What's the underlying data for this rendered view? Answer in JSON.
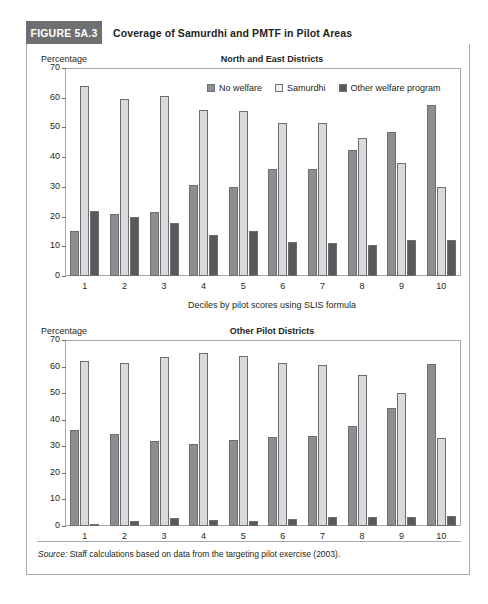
{
  "figure": {
    "badge": "FIGURE 5A.3",
    "title": "Coverage of Samurdhi and PMTF in Pilot Areas",
    "source_label": "Source:",
    "source_text": " Staff calculations based on data from the targeting pilot exercise (2003)."
  },
  "legend": {
    "items": [
      {
        "label": "No welfare",
        "color": "#8d8e90",
        "key": "nowelfare"
      },
      {
        "label": "Samurdhi",
        "color": "#f1f1f1",
        "key": "samurdhi"
      },
      {
        "label": "Other welfare program",
        "color": "#58595b",
        "key": "other"
      }
    ]
  },
  "chart_data": [
    {
      "type": "bar",
      "title": "North and East Districts",
      "ylabel": "Percentage",
      "xlabel": "Deciles by pilot scores using SLIS formula",
      "categories": [
        "1",
        "2",
        "3",
        "4",
        "5",
        "6",
        "7",
        "8",
        "9",
        "10"
      ],
      "ylim": [
        0,
        70
      ],
      "yticks": [
        0,
        10,
        20,
        30,
        40,
        50,
        60,
        70
      ],
      "grid": false,
      "legend_position": "top-right",
      "series": [
        {
          "name": "No welfare",
          "color": "#8d8e90",
          "values": [
            15.0,
            21.0,
            21.5,
            30.5,
            30.0,
            36.0,
            36.0,
            42.5,
            48.5,
            57.5
          ]
        },
        {
          "name": "Samurdhi",
          "color": "#d9dadb",
          "values": [
            64.0,
            59.5,
            60.5,
            56.0,
            55.5,
            51.5,
            51.5,
            46.5,
            38.0,
            30.0
          ]
        },
        {
          "name": "Other welfare program",
          "color": "#58595b",
          "values": [
            22.0,
            20.0,
            18.0,
            13.8,
            15.0,
            11.5,
            11.0,
            10.5,
            12.0,
            12.0
          ]
        }
      ]
    },
    {
      "type": "bar",
      "title": "Other Pilot Districts",
      "ylabel": "Percentage",
      "xlabel": "",
      "categories": [
        "1",
        "2",
        "3",
        "4",
        "5",
        "6",
        "7",
        "8",
        "9",
        "10"
      ],
      "ylim": [
        0,
        70
      ],
      "yticks": [
        0,
        10,
        20,
        30,
        40,
        50,
        60,
        70
      ],
      "grid": false,
      "legend_position": "none",
      "series": [
        {
          "name": "No welfare",
          "color": "#8d8e90",
          "values": [
            36.0,
            34.5,
            32.0,
            31.0,
            32.5,
            33.5,
            34.0,
            37.5,
            44.5,
            61.0
          ]
        },
        {
          "name": "Samurdhi",
          "color": "#d9dadb",
          "values": [
            62.0,
            61.5,
            63.5,
            65.0,
            64.0,
            61.5,
            60.5,
            57.0,
            50.0,
            33.0
          ]
        },
        {
          "name": "Other welfare program",
          "color": "#58595b",
          "values": [
            0.8,
            1.8,
            3.0,
            2.3,
            1.7,
            2.8,
            3.3,
            3.3,
            3.2,
            3.8
          ]
        }
      ]
    }
  ]
}
